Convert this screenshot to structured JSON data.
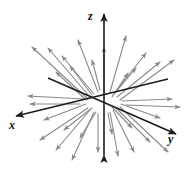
{
  "figure": {
    "name": "radial-vector-field-3d",
    "width": 193,
    "height": 186,
    "background_color": "#ffffff"
  },
  "axes": {
    "origin": {
      "x": 104,
      "y": 103
    },
    "color": "#1c1c1c",
    "line_width": 1.6,
    "items": [
      {
        "id": "z",
        "label": "z",
        "name": "axis-z",
        "description": "vertical axis, arrowhead at top",
        "x1": 104,
        "y1": 155,
        "x2": 104,
        "y2": 14,
        "arrow_at_start": true,
        "arrow_at_end": true,
        "label_x": 88,
        "label_y": 10
      },
      {
        "id": "x",
        "label": "x",
        "name": "axis-x",
        "description": "axis toward viewer, lower-left, arrowhead at far end",
        "x1": 168,
        "y1": 79,
        "x2": 16,
        "y2": 116,
        "arrow_at_start": false,
        "arrow_at_end": true,
        "label_x": 9,
        "label_y": 119
      },
      {
        "id": "y",
        "label": "y",
        "name": "axis-y",
        "description": "axis to the right, lower-right, arrowhead at far end",
        "x1": 48,
        "y1": 78,
        "x2": 176,
        "y2": 134,
        "arrow_at_start": false,
        "arrow_at_end": true,
        "label_x": 168,
        "label_y": 133
      }
    ]
  },
  "vector_field": {
    "name": "radial-arrows",
    "type": "radial-outward",
    "description": "Arrows emanate from the origin and point outward in every direction, lengths increasing with distance.",
    "color": "#8a8a8a",
    "line_width": 1.1,
    "arrowhead_length": 5,
    "arrowhead_width": 3.4,
    "arrow_count": 32,
    "arrows": [
      {
        "x1": 104,
        "y1": 92,
        "x2": 104,
        "y2": 47
      },
      {
        "x1": 110,
        "y1": 92,
        "x2": 126,
        "y2": 36
      },
      {
        "x1": 113,
        "y1": 95,
        "x2": 146,
        "y2": 53
      },
      {
        "x1": 117,
        "y1": 97,
        "x2": 160,
        "y2": 62
      },
      {
        "x1": 120,
        "y1": 100,
        "x2": 174,
        "y2": 60
      },
      {
        "x1": 115,
        "y1": 93,
        "x2": 136,
        "y2": 68
      },
      {
        "x1": 112,
        "y1": 97,
        "x2": 128,
        "y2": 73
      },
      {
        "x1": 122,
        "y1": 101,
        "x2": 172,
        "y2": 99
      },
      {
        "x1": 126,
        "y1": 105,
        "x2": 180,
        "y2": 107
      },
      {
        "x1": 98,
        "y1": 92,
        "x2": 78,
        "y2": 40
      },
      {
        "x1": 94,
        "y1": 94,
        "x2": 62,
        "y2": 56
      },
      {
        "x1": 90,
        "y1": 97,
        "x2": 48,
        "y2": 48
      },
      {
        "x1": 88,
        "y1": 99,
        "x2": 32,
        "y2": 47
      },
      {
        "x1": 92,
        "y1": 95,
        "x2": 70,
        "y2": 66
      },
      {
        "x1": 86,
        "y1": 100,
        "x2": 56,
        "y2": 72
      },
      {
        "x1": 84,
        "y1": 99,
        "x2": 28,
        "y2": 96
      },
      {
        "x1": 80,
        "y1": 104,
        "x2": 30,
        "y2": 104
      },
      {
        "x1": 98,
        "y1": 114,
        "x2": 98,
        "y2": 152
      },
      {
        "x1": 94,
        "y1": 112,
        "x2": 72,
        "y2": 160
      },
      {
        "x1": 90,
        "y1": 110,
        "x2": 56,
        "y2": 150
      },
      {
        "x1": 88,
        "y1": 108,
        "x2": 40,
        "y2": 140
      },
      {
        "x1": 92,
        "y1": 108,
        "x2": 64,
        "y2": 130
      },
      {
        "x1": 96,
        "y1": 112,
        "x2": 80,
        "y2": 138
      },
      {
        "x1": 110,
        "y1": 112,
        "x2": 118,
        "y2": 156
      },
      {
        "x1": 113,
        "y1": 110,
        "x2": 134,
        "y2": 152
      },
      {
        "x1": 116,
        "y1": 108,
        "x2": 150,
        "y2": 142
      },
      {
        "x1": 120,
        "y1": 107,
        "x2": 168,
        "y2": 152
      },
      {
        "x1": 112,
        "y1": 107,
        "x2": 132,
        "y2": 128
      },
      {
        "x1": 108,
        "y1": 113,
        "x2": 112,
        "y2": 134
      },
      {
        "x1": 121,
        "y1": 104,
        "x2": 160,
        "y2": 118
      },
      {
        "x1": 86,
        "y1": 104,
        "x2": 44,
        "y2": 120
      },
      {
        "x1": 100,
        "y1": 90,
        "x2": 92,
        "y2": 60
      }
    ]
  },
  "labels": {
    "z": "z",
    "x": "x",
    "y": "y"
  }
}
